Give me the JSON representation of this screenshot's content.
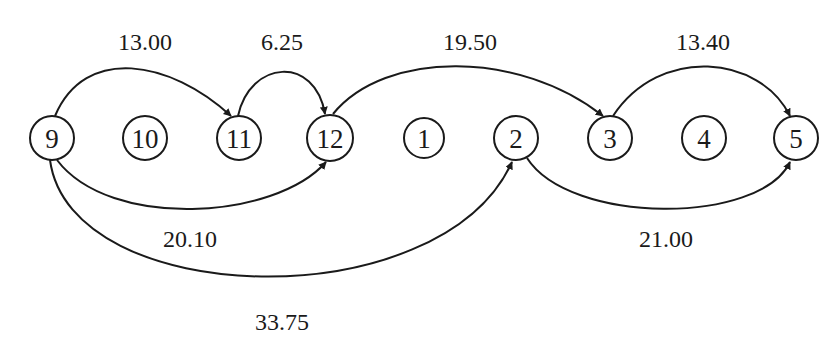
{
  "diagram": {
    "type": "directed-graph",
    "nodes": [
      {
        "id": "9",
        "label": "9",
        "x": 52,
        "y": 138
      },
      {
        "id": "10",
        "label": "10",
        "x": 145,
        "y": 138
      },
      {
        "id": "11",
        "label": "11",
        "x": 239,
        "y": 138
      },
      {
        "id": "12",
        "label": "12",
        "x": 330,
        "y": 138
      },
      {
        "id": "1",
        "label": "1",
        "x": 424,
        "y": 138
      },
      {
        "id": "2",
        "label": "2",
        "x": 516,
        "y": 138
      },
      {
        "id": "3",
        "label": "3",
        "x": 610,
        "y": 138
      },
      {
        "id": "4",
        "label": "4",
        "x": 704,
        "y": 138
      },
      {
        "id": "5",
        "label": "5",
        "x": 796,
        "y": 138
      }
    ],
    "edges": [
      {
        "from": "9",
        "to": "11",
        "label": "13.00",
        "side": "above"
      },
      {
        "from": "11",
        "to": "12",
        "label": "6.25",
        "side": "above"
      },
      {
        "from": "12",
        "to": "3",
        "label": "19.50",
        "side": "above"
      },
      {
        "from": "3",
        "to": "5",
        "label": "13.40",
        "side": "above"
      },
      {
        "from": "9",
        "to": "12",
        "label": "20.10",
        "side": "below"
      },
      {
        "from": "9",
        "to": "2",
        "label": "33.75",
        "side": "below"
      },
      {
        "from": "2",
        "to": "5",
        "label": "21.00",
        "side": "below"
      }
    ]
  }
}
